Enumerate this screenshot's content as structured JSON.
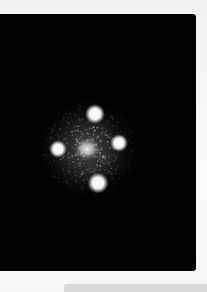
{
  "image": {
    "subject": "quadruply lensed quasar (Einstein Cross) on black sky",
    "background_color": "#020202",
    "page_color": "#f4f4f4",
    "glow_color": "#ffffff",
    "bar_color": "#d9d9d9"
  },
  "sources": [
    {
      "name": "image-top",
      "label": "top lensed image"
    },
    {
      "name": "image-left",
      "label": "left lensed image"
    },
    {
      "name": "image-center",
      "label": "central lens galaxy"
    },
    {
      "name": "image-right",
      "label": "right lensed image"
    },
    {
      "name": "image-bottom",
      "label": "bottom lensed image"
    }
  ]
}
